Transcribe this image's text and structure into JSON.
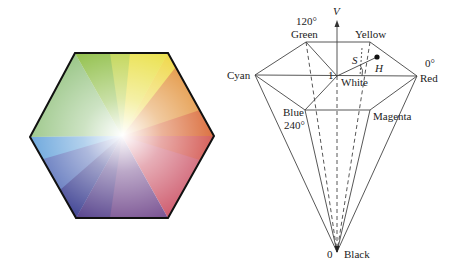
{
  "figure": {
    "left_panel": {
      "description": "HSV hexagon color wheel",
      "shape": "hexagon",
      "center_color": "#ffffff",
      "vertex_colors": {
        "top_left": "#7fb83a",
        "top_right": "#f2e23a",
        "right": "#d4451e",
        "bottom_right": "#c83a5a",
        "bottom_left": "#2a2a7a",
        "left": "#6cb4e0"
      },
      "border_color": "#111111"
    },
    "right_panel": {
      "description": "HSV hexcone model",
      "axis_label": "V",
      "labels": {
        "green_angle": "120°",
        "green": "Green",
        "yellow": "Yellow",
        "cyan": "Cyan",
        "red_angle": "0°",
        "red": "Red",
        "white": "White",
        "white_value": "1",
        "blue": "Blue",
        "blue_angle": "240°",
        "magenta": "Magenta",
        "black_value": "0",
        "black": "Black",
        "saturation": "S",
        "hue": "H"
      }
    }
  }
}
